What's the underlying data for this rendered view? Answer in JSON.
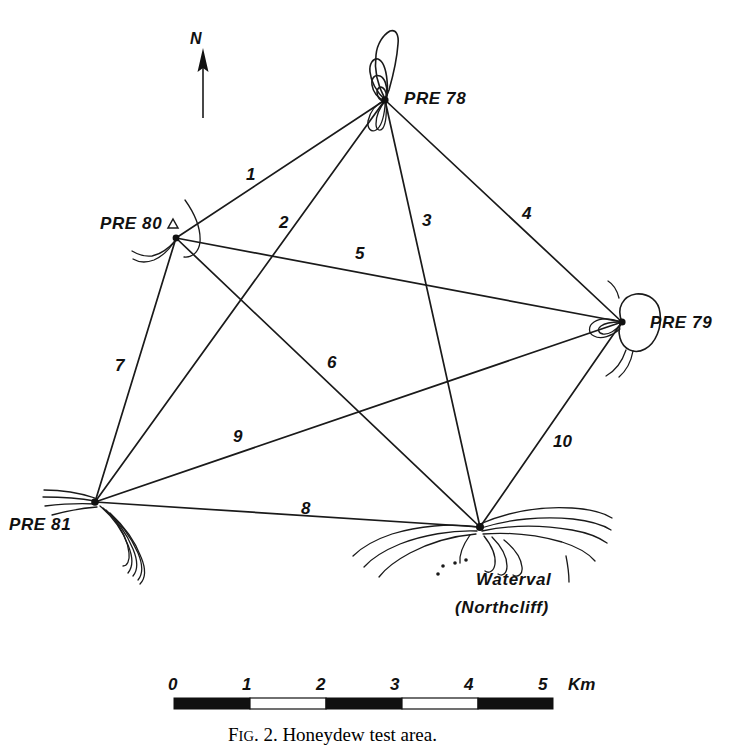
{
  "figure": {
    "caption_prefix": "F",
    "caption_smallcaps": "IG",
    "caption_rest": ". 2. Honeydew test area.",
    "caption_full": "FIG. 2. Honeydew test area."
  },
  "compass": {
    "label": "N",
    "icon": "north-arrow-icon"
  },
  "stations": [
    {
      "id": "pre78",
      "label": "PRE 78",
      "x": 385,
      "y": 100,
      "label_x": 404,
      "label_y": 104,
      "marker": "contour-peak"
    },
    {
      "id": "pre80",
      "label": "PRE 80",
      "x": 176,
      "y": 238,
      "label_x": 100,
      "label_y": 228,
      "marker": "triangle",
      "marker_x": 173,
      "marker_y": 224
    },
    {
      "id": "pre79",
      "label": "PRE 79",
      "x": 622,
      "y": 322,
      "label_x": 650,
      "label_y": 327,
      "marker": "contour-blob"
    },
    {
      "id": "pre81",
      "label": "PRE 81",
      "x": 95,
      "y": 502,
      "label_x": 9,
      "label_y": 528,
      "marker": "contour-ridge"
    },
    {
      "id": "waterval",
      "label": "Waterval",
      "sublabel": "(Northcliff)",
      "x": 480,
      "y": 527,
      "label_x": 476,
      "label_y": 585,
      "sublabel_x": 455,
      "sublabel_y": 612,
      "marker": "contour-ridge"
    }
  ],
  "lines": [
    {
      "label": "1",
      "from": "pre78",
      "to": "pre80",
      "label_x": 246,
      "label_y": 180
    },
    {
      "label": "2",
      "from": "pre78",
      "to": "pre81",
      "label_x": 279,
      "label_y": 228
    },
    {
      "label": "3",
      "from": "pre78",
      "to": "waterval",
      "label_x": 422,
      "label_y": 226
    },
    {
      "label": "4",
      "from": "pre78",
      "to": "pre79",
      "label_x": 522,
      "label_y": 219
    },
    {
      "label": "5",
      "from": "pre80",
      "to": "pre79",
      "label_x": 355,
      "label_y": 259
    },
    {
      "label": "6",
      "from": "pre80",
      "to": "waterval",
      "label_x": 327,
      "label_y": 368
    },
    {
      "label": "7",
      "from": "pre80",
      "to": "pre81",
      "label_x": 122,
      "label_y": 371
    },
    {
      "label": "8",
      "from": "pre81",
      "to": "waterval",
      "label_x": 301,
      "label_y": 514
    },
    {
      "label": "9",
      "from": "pre81",
      "to": "pre79",
      "label_x": 239,
      "label_y": 442
    },
    {
      "label": "10",
      "from": "pre79",
      "to": "waterval",
      "label_x": 556,
      "label_y": 447
    }
  ],
  "scale_bar": {
    "unit": "Km",
    "unit_x": 580,
    "unit_y": 690,
    "ticks": [
      {
        "label": "0",
        "x": 175
      },
      {
        "label": "1",
        "x": 249
      },
      {
        "label": "2",
        "x": 323
      },
      {
        "label": "3",
        "x": 397
      },
      {
        "label": "4",
        "x": 471
      },
      {
        "label": "5",
        "x": 545
      }
    ],
    "bar_left": 174,
    "bar_right": 553,
    "bar_top": 698,
    "bar_height": 11,
    "segments": [
      "black",
      "white",
      "black",
      "white",
      "black"
    ]
  },
  "colors": {
    "ink": "#111111",
    "paper": "#ffffff"
  }
}
